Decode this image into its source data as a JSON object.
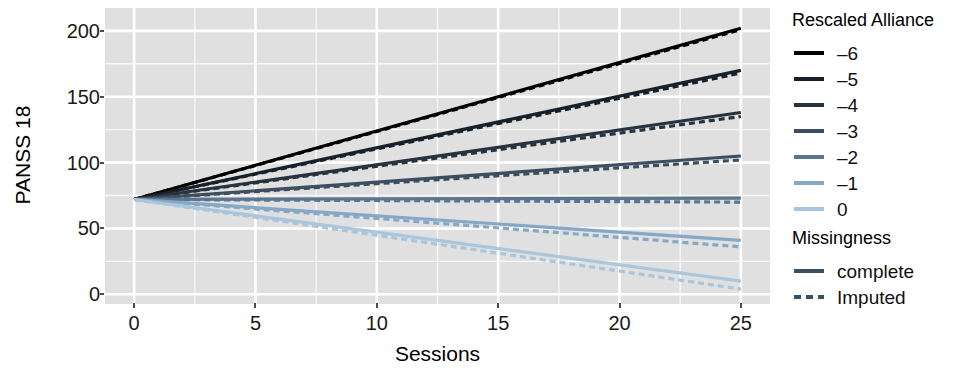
{
  "chart_data": {
    "type": "line",
    "title": "",
    "xlabel": "Sessions",
    "ylabel": "PANSS 18",
    "xlim": [
      0,
      25
    ],
    "ylim": [
      0,
      210
    ],
    "xticks": [
      0,
      5,
      10,
      15,
      20,
      25
    ],
    "yticks": [
      0,
      50,
      100,
      150,
      200
    ],
    "grid": true,
    "panel_background": "#e0e0e0",
    "grid_color": "#ffffff",
    "intercept": 72,
    "legends": [
      {
        "title": "Rescaled Alliance",
        "position": "right-top",
        "entries": [
          {
            "label": "–6",
            "color": "#000000"
          },
          {
            "label": "–5",
            "color": "#17202b"
          },
          {
            "label": "–4",
            "color": "#27333f"
          },
          {
            "label": "–3",
            "color": "#3d4e5f"
          },
          {
            "label": "–2",
            "color": "#5b7591"
          },
          {
            "label": "–1",
            "color": "#85a8c6"
          },
          {
            "label": "0",
            "color": "#a9c6dd"
          }
        ]
      },
      {
        "title": "Missingness",
        "position": "right-bottom",
        "entries": [
          {
            "label": "complete",
            "style": "solid",
            "color": "#3d4e5f"
          },
          {
            "label": "Imputed",
            "style": "dashed",
            "color": "#3d4e5f"
          }
        ]
      }
    ],
    "series": [
      {
        "name": "–6",
        "missingness": "complete",
        "color": "#000000",
        "style": "solid",
        "x": [
          0,
          25
        ],
        "y": [
          72,
          202
        ]
      },
      {
        "name": "–6",
        "missingness": "Imputed",
        "color": "#000000",
        "style": "dashed",
        "x": [
          0,
          25
        ],
        "y": [
          72,
          201
        ]
      },
      {
        "name": "–5",
        "missingness": "complete",
        "color": "#17202b",
        "style": "solid",
        "x": [
          0,
          25
        ],
        "y": [
          72,
          170
        ]
      },
      {
        "name": "–5",
        "missingness": "Imputed",
        "color": "#17202b",
        "style": "dashed",
        "x": [
          0,
          25
        ],
        "y": [
          72,
          168
        ]
      },
      {
        "name": "–4",
        "missingness": "complete",
        "color": "#27333f",
        "style": "solid",
        "x": [
          0,
          25
        ],
        "y": [
          72,
          138
        ]
      },
      {
        "name": "–4",
        "missingness": "Imputed",
        "color": "#27333f",
        "style": "dashed",
        "x": [
          0,
          25
        ],
        "y": [
          72,
          135
        ]
      },
      {
        "name": "–3",
        "missingness": "complete",
        "color": "#3d4e5f",
        "style": "solid",
        "x": [
          0,
          25
        ],
        "y": [
          72,
          105
        ]
      },
      {
        "name": "–3",
        "missingness": "Imputed",
        "color": "#3d4e5f",
        "style": "dashed",
        "x": [
          0,
          25
        ],
        "y": [
          72,
          102
        ]
      },
      {
        "name": "–2",
        "missingness": "complete",
        "color": "#5b7591",
        "style": "solid",
        "x": [
          0,
          25
        ],
        "y": [
          72,
          73
        ]
      },
      {
        "name": "–2",
        "missingness": "Imputed",
        "color": "#5b7591",
        "style": "dashed",
        "x": [
          0,
          25
        ],
        "y": [
          72,
          70
        ]
      },
      {
        "name": "–1",
        "missingness": "complete",
        "color": "#85a8c6",
        "style": "solid",
        "x": [
          0,
          25
        ],
        "y": [
          72,
          41
        ]
      },
      {
        "name": "–1",
        "missingness": "Imputed",
        "color": "#85a8c6",
        "style": "dashed",
        "x": [
          0,
          25
        ],
        "y": [
          72,
          36
        ]
      },
      {
        "name": "0",
        "missingness": "complete",
        "color": "#a9c6dd",
        "style": "solid",
        "x": [
          0,
          25
        ],
        "y": [
          72,
          10
        ]
      },
      {
        "name": "0",
        "missingness": "Imputed",
        "color": "#a9c6dd",
        "style": "dashed",
        "x": [
          0,
          25
        ],
        "y": [
          72,
          4
        ]
      }
    ]
  }
}
